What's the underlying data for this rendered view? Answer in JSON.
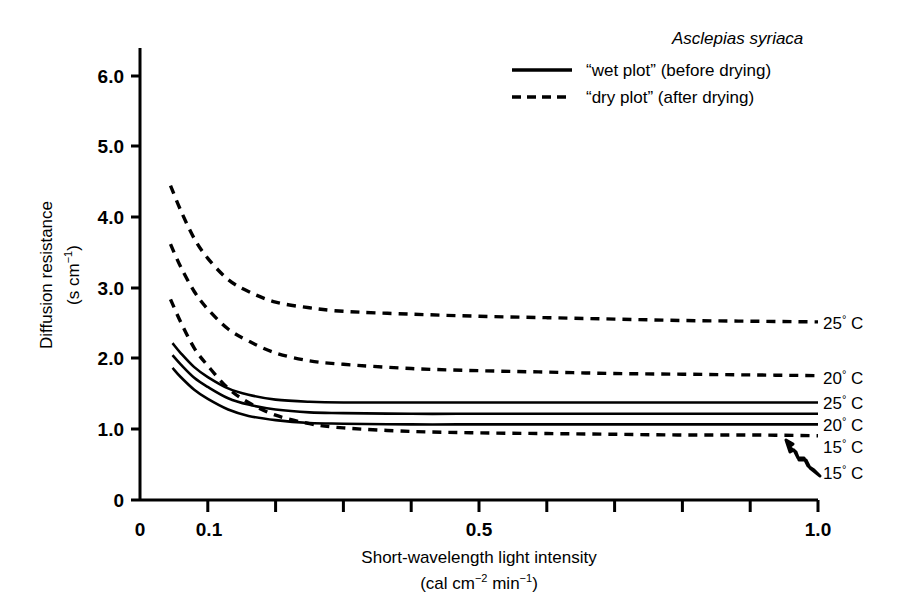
{
  "chart_data": {
    "type": "line",
    "title": "",
    "xlabel": "Short-wavelength light intensity (cal cm−2 min−1)",
    "xlabel_line1": "Short-wavelength light intensity",
    "xlabel_line2_pre": "(cal cm",
    "xlabel_line2_sup1": "−2",
    "xlabel_line2_mid": " min",
    "xlabel_line2_sup2": "−1",
    "xlabel_line2_post": ")",
    "ylabel": "Diffusion resistance (s cm−1)",
    "ylabel_line1": "Diffusion resistance",
    "ylabel_line2_pre": "(s cm",
    "ylabel_line2_sup": "−1",
    "ylabel_line2_post": ")",
    "xlim": [
      0,
      1.0
    ],
    "ylim": [
      0,
      6.5
    ],
    "grid": false,
    "x_ticks_major": [
      0,
      0.1,
      0.5,
      1.0
    ],
    "x_tick_labels": [
      "0",
      "0.1",
      "0.5",
      "1.0"
    ],
    "x_ticks_minor": [
      0.1,
      0.2,
      0.3,
      0.4,
      0.5,
      0.6,
      0.7,
      0.8,
      0.9,
      1.0
    ],
    "y_ticks": [
      0,
      1.0,
      2.0,
      3.0,
      4.0,
      5.0,
      6.0
    ],
    "y_tick_labels": [
      "0",
      "1.0",
      "2.0",
      "3.0",
      "4.0",
      "5.0",
      "6.0"
    ],
    "legend_position": "top-right",
    "legend": [
      {
        "style": "solid",
        "label": "“wet plot” (before drying)"
      },
      {
        "style": "dashed",
        "label": "“dry plot” (after drying)"
      }
    ],
    "legend_species": "Asclepias syriaca",
    "series": [
      {
        "name": "dry-25C",
        "plot": "dry plot",
        "temperature": "25° C",
        "style": "dashed",
        "end_label": "25° C",
        "x": [
          0.045,
          0.06,
          0.08,
          0.1,
          0.13,
          0.16,
          0.2,
          0.25,
          0.3,
          0.4,
          0.5,
          0.6,
          0.7,
          0.8,
          0.9,
          1.0
        ],
        "y": [
          4.45,
          4.1,
          3.7,
          3.42,
          3.12,
          2.95,
          2.8,
          2.72,
          2.67,
          2.63,
          2.6,
          2.58,
          2.56,
          2.54,
          2.53,
          2.52
        ]
      },
      {
        "name": "dry-20C",
        "plot": "dry plot",
        "temperature": "20° C",
        "style": "dashed",
        "end_label": "20° C",
        "x": [
          0.045,
          0.06,
          0.08,
          0.1,
          0.13,
          0.16,
          0.2,
          0.25,
          0.3,
          0.4,
          0.5,
          0.6,
          0.7,
          0.8,
          0.9,
          1.0
        ],
        "y": [
          3.62,
          3.3,
          2.95,
          2.7,
          2.42,
          2.25,
          2.08,
          1.97,
          1.92,
          1.86,
          1.83,
          1.81,
          1.79,
          1.78,
          1.77,
          1.76
        ]
      },
      {
        "name": "dry-15C",
        "plot": "dry plot",
        "temperature": "15° C",
        "style": "dashed",
        "end_label": "15° C",
        "x": [
          0.045,
          0.06,
          0.08,
          0.1,
          0.13,
          0.16,
          0.2,
          0.25,
          0.3,
          0.4,
          0.5,
          0.6,
          0.7,
          0.8,
          0.9,
          1.0
        ],
        "y": [
          2.84,
          2.52,
          2.15,
          1.9,
          1.58,
          1.38,
          1.2,
          1.08,
          1.02,
          0.97,
          0.95,
          0.94,
          0.93,
          0.92,
          0.92,
          0.91
        ]
      },
      {
        "name": "wet-25C",
        "plot": "wet plot",
        "temperature": "25° C",
        "style": "solid",
        "end_label": "25° C",
        "x": [
          0.048,
          0.06,
          0.08,
          0.1,
          0.13,
          0.16,
          0.2,
          0.25,
          0.3,
          0.4,
          0.5,
          0.6,
          0.7,
          0.8,
          0.9,
          1.0
        ],
        "y": [
          2.22,
          2.08,
          1.88,
          1.74,
          1.58,
          1.49,
          1.42,
          1.39,
          1.38,
          1.38,
          1.38,
          1.38,
          1.38,
          1.38,
          1.38,
          1.38
        ]
      },
      {
        "name": "wet-20C",
        "plot": "wet plot",
        "temperature": "20° C",
        "style": "solid",
        "end_label": "20° C",
        "x": [
          0.048,
          0.06,
          0.08,
          0.1,
          0.13,
          0.16,
          0.2,
          0.25,
          0.3,
          0.4,
          0.5,
          0.6,
          0.7,
          0.8,
          0.9,
          1.0
        ],
        "y": [
          2.05,
          1.92,
          1.73,
          1.6,
          1.44,
          1.35,
          1.28,
          1.24,
          1.23,
          1.22,
          1.22,
          1.22,
          1.22,
          1.22,
          1.22,
          1.22
        ]
      },
      {
        "name": "wet-15C",
        "plot": "wet plot",
        "temperature": "15° C",
        "style": "solid",
        "end_label": "15° C",
        "x": [
          0.048,
          0.06,
          0.08,
          0.1,
          0.13,
          0.16,
          0.2,
          0.25,
          0.3,
          0.4,
          0.5,
          0.6,
          0.7,
          0.8,
          0.9,
          1.0
        ],
        "y": [
          1.87,
          1.74,
          1.56,
          1.43,
          1.28,
          1.19,
          1.13,
          1.09,
          1.08,
          1.07,
          1.07,
          1.07,
          1.07,
          1.07,
          1.07,
          1.07
        ]
      }
    ],
    "annotations": [
      {
        "name": "arrow-to-dry-15C",
        "text": "15° C",
        "target_series": "dry-15C"
      }
    ]
  },
  "colors": {
    "ink": "#000000",
    "background": "#ffffff"
  }
}
